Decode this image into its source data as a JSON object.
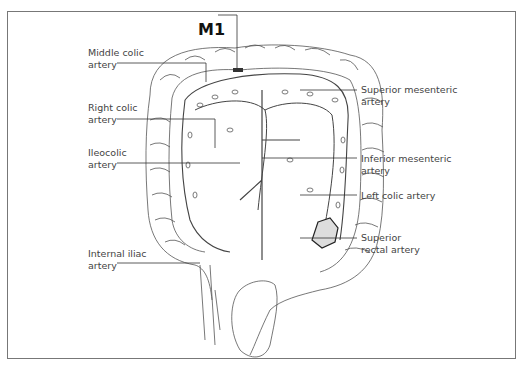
{
  "figure": {
    "title_marker": "M1",
    "labels": {
      "middle_colic": [
        "Middle colic",
        "artery"
      ],
      "right_colic": [
        "Right colic",
        "artery"
      ],
      "ileocolic": [
        "Ileocolic",
        "artery"
      ],
      "internal_iliac": [
        "Internal iliac",
        "artery"
      ],
      "superior_mesenteric": [
        "Superior mesenteric",
        "artery"
      ],
      "inferior_mesenteric": [
        "Inferior mesenteric",
        "artery"
      ],
      "left_colic": [
        "Left colic artery"
      ],
      "superior_rectal": [
        "Superior",
        "rectal artery"
      ]
    }
  }
}
